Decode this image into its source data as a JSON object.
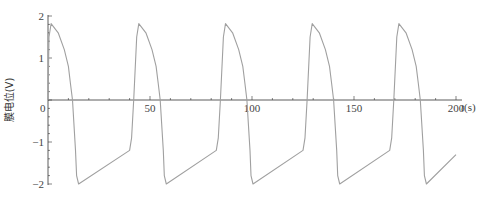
{
  "chart_data": {
    "type": "line",
    "title": "",
    "xlabel": "t(s)",
    "ylabel": "膜电位(V)",
    "xlim": [
      0,
      200
    ],
    "ylim": [
      -2,
      2
    ],
    "x_ticks": [
      0,
      50,
      100,
      150,
      200
    ],
    "x_tick_labels": [
      "0",
      "50",
      "100",
      "150",
      "200"
    ],
    "y_ticks": [
      -2,
      -1,
      0,
      1,
      2
    ],
    "y_tick_labels": [
      "-2",
      "-1",
      "0",
      "1",
      "2"
    ],
    "grid": false,
    "legend": null,
    "series": [
      {
        "name": "membrane potential",
        "color": "#a0a0a0",
        "x": [
          0,
          0.5,
          1.5,
          5,
          8,
          10,
          11,
          12,
          13.5,
          14,
          15,
          40,
          41,
          42,
          43.5,
          44.5,
          48,
          51,
          53,
          54,
          55,
          56.5,
          57,
          58,
          82.5,
          83.5,
          84.5,
          86,
          87,
          90.5,
          93.5,
          95.5,
          96.5,
          97.5,
          99,
          99.5,
          100.5,
          125,
          126,
          127,
          128.5,
          129.5,
          133,
          136,
          138,
          139,
          140,
          141.5,
          142,
          143,
          167.5,
          168.5,
          169.5,
          171,
          172,
          175.5,
          178.5,
          180.5,
          181.5,
          182.5,
          184,
          184.5,
          185.5,
          200
        ],
        "y": [
          0.0,
          1.5,
          1.82,
          1.6,
          1.2,
          0.8,
          0.4,
          0.0,
          -1.2,
          -1.8,
          -2.0,
          -1.2,
          -0.9,
          0.0,
          1.5,
          1.82,
          1.6,
          1.2,
          0.8,
          0.4,
          0.0,
          -1.2,
          -1.8,
          -2.0,
          -1.2,
          -0.9,
          0.0,
          1.5,
          1.82,
          1.6,
          1.2,
          0.8,
          0.4,
          0.0,
          -1.2,
          -1.8,
          -2.0,
          -1.2,
          -0.9,
          0.0,
          1.5,
          1.82,
          1.6,
          1.2,
          0.8,
          0.4,
          0.0,
          -1.2,
          -1.8,
          -2.0,
          -1.2,
          -0.9,
          0.0,
          1.5,
          1.82,
          1.6,
          1.2,
          0.8,
          0.4,
          0.0,
          -1.2,
          -1.8,
          -2.0,
          -1.3
        ]
      }
    ]
  },
  "layout": {
    "origin_px": [
      48,
      100
    ],
    "x_scale_px_per_unit": 2.04,
    "y_scale_px_per_unit": 42,
    "axis_color": "#333333",
    "line_color": "#a0a0a0"
  }
}
